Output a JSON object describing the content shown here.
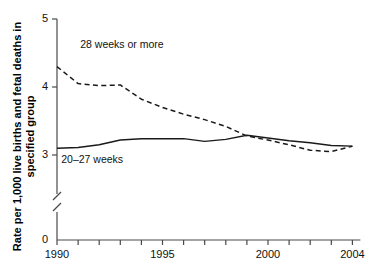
{
  "chart_data": {
    "type": "line",
    "title": "",
    "subtitle": "",
    "xlabel": "",
    "ylabel": "Rate per 1,000 live births and fetal deaths in specified group",
    "x": [
      1990,
      1991,
      1992,
      1993,
      1994,
      1995,
      1996,
      1997,
      1998,
      1999,
      2000,
      2001,
      2002,
      2003,
      2004
    ],
    "xlim": [
      1990,
      2004
    ],
    "ylim": [
      3.0,
      5.0
    ],
    "y_axis_break": true,
    "y_axis_break_note": "Axis broken between 0 and 3",
    "grid": false,
    "legend_position": "inline-annotations",
    "xtick_labels": [
      "1990",
      "1995",
      "2000",
      "2004"
    ],
    "xtick_label_years": [
      1990,
      1995,
      2000,
      2004
    ],
    "xtick_years_all": [
      1990,
      1991,
      1992,
      1993,
      1994,
      1995,
      1996,
      1997,
      1998,
      1999,
      2000,
      2001,
      2002,
      2003,
      2004
    ],
    "ytick_labels": [
      "0",
      "3",
      "4",
      "5"
    ],
    "ytick_values": [
      0,
      3,
      4,
      5
    ],
    "series": [
      {
        "name": "28 weeks or more",
        "style": "dashed",
        "color": "#1a1a1a",
        "values": [
          4.3,
          4.05,
          4.02,
          4.03,
          3.82,
          3.7,
          3.6,
          3.52,
          3.42,
          3.28,
          3.22,
          3.15,
          3.07,
          3.05,
          3.13
        ],
        "label_x": 1991.1,
        "label_y": 4.62
      },
      {
        "name": "20–27 weeks",
        "style": "solid",
        "color": "#1a1a1a",
        "values": [
          3.1,
          3.11,
          3.15,
          3.22,
          3.24,
          3.24,
          3.24,
          3.2,
          3.23,
          3.29,
          3.25,
          3.21,
          3.18,
          3.14,
          3.13
        ],
        "label_x": 1990.2,
        "label_y": 2.92
      }
    ]
  }
}
